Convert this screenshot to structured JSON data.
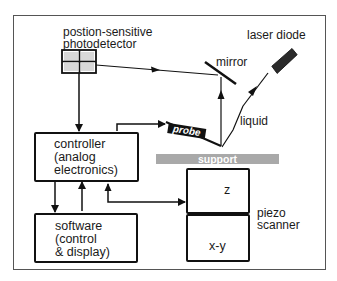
{
  "diagram": {
    "components": {
      "photodetector": {
        "label_line1": "postion-sensitive",
        "label_line2": "photodetector"
      },
      "laser_diode": {
        "label": "laser diode"
      },
      "mirror": {
        "label": "mirror"
      },
      "liquid": {
        "label": "liquid"
      },
      "probe": {
        "label": "probe"
      },
      "support": {
        "label": "support"
      },
      "controller": {
        "line1": "controller",
        "line2": "(analog",
        "line3": "electronics)"
      },
      "software": {
        "line1": "software",
        "line2": "(control",
        "line3": "& display)"
      },
      "piezo_scanner": {
        "label_line1": "piezo",
        "label_line2": "scanner",
        "z_label": "z",
        "xy_label": "x-y"
      }
    },
    "colors": {
      "line": "#111111",
      "support_fill": "#a9a9a9",
      "laser_fill": "#2b2b2b",
      "detector_cell": "#d8d8d8"
    }
  }
}
